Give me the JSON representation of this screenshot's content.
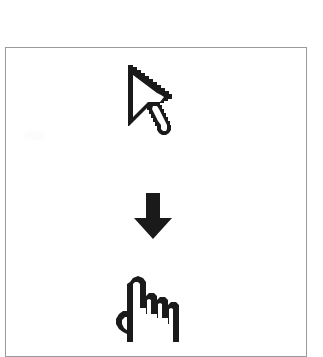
{
  "figure": {
    "background_color": "#ffffff",
    "frame": {
      "name": "figure-border",
      "stroke_color": "#9a9a9a",
      "stroke_width": 1,
      "x": 5,
      "y": 47,
      "width": 302,
      "height": 310,
      "cropped_at_bottom": true
    },
    "ink_color": "#1a1a1a",
    "icons": [
      {
        "id": "pointer-cursor",
        "name": "mouse-pointer-cursor-icon",
        "label": "Arrow pointer cursor",
        "style": "outline",
        "order": 1,
        "x": 124,
        "y": 63,
        "width": 52,
        "height": 88
      },
      {
        "id": "down-arrow",
        "name": "down-arrow-icon",
        "label": "Downward transition arrow",
        "style": "solid",
        "order": 2,
        "x": 132,
        "y": 191,
        "width": 42,
        "height": 50
      },
      {
        "id": "hand-cursor",
        "name": "pointing-hand-cursor-icon",
        "label": "Pointing hand cursor",
        "style": "outline",
        "order": 3,
        "x": 114,
        "y": 274,
        "width": 70,
        "height": 68,
        "cropped_at_bottom": true
      }
    ]
  }
}
